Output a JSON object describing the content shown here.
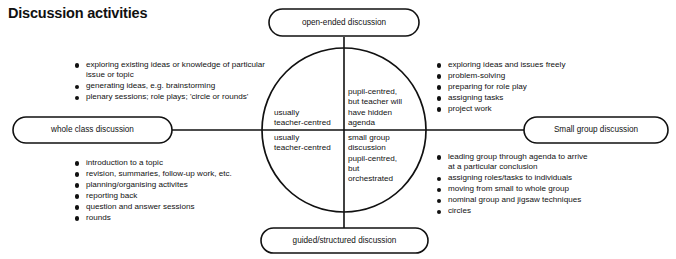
{
  "page": {
    "title": "Discussion activities",
    "background_color": "#ffffff",
    "line_color": "#111111",
    "text_color": "#111111"
  },
  "diagram": {
    "type": "quadrant-circle-diagram",
    "center": {
      "x": 344,
      "y": 130,
      "radius": 82
    },
    "nodes": [
      {
        "id": "open-ended",
        "label": "open-ended discussion",
        "position": "top"
      },
      {
        "id": "guided-structured",
        "label": "guided/structured discussion",
        "position": "bottom"
      },
      {
        "id": "whole-class",
        "label": "whole class discussion",
        "position": "left"
      },
      {
        "id": "small-group",
        "label": "Small group discussion",
        "position": "right"
      }
    ],
    "quadrants": [
      {
        "id": "top-left",
        "lines": [
          "usually",
          "teacher-centred"
        ]
      },
      {
        "id": "bottom-left",
        "lines": [
          "usually",
          "teacher-centred"
        ]
      },
      {
        "id": "top-right",
        "lines": [
          "pupil-centred,",
          "but teacher will",
          "have hidden",
          "agenda"
        ]
      },
      {
        "id": "bottom-right",
        "lines": [
          "small group",
          "discussion",
          "pupil-centred,",
          "but",
          "orchestrated"
        ]
      }
    ],
    "bullet_groups": [
      {
        "id": "top-left-activities",
        "items": [
          "exploring existing ideas or knowledge of particular\nissue or topic",
          "generating ideas, e.g. brainstorming",
          "plenary sessions; role plays; 'circle or rounds'"
        ]
      },
      {
        "id": "top-right-activities",
        "items": [
          "exploring ideas and issues freely",
          "problem-solving",
          "preparing for role play",
          "assigning tasks",
          "project work"
        ]
      },
      {
        "id": "bottom-left-activities",
        "items": [
          "introduction to a topic",
          "revision, summaries, follow-up work, etc.",
          "planning/organising activites",
          "reporting back",
          "question and answer sessions",
          "rounds"
        ]
      },
      {
        "id": "bottom-right-activities",
        "items": [
          "leading group through agenda to arrive\nat a particular conclusion",
          "assigning roles/tasks to individuals",
          "moving from small to whole group",
          "nominal group and jigsaw techniques",
          "circles"
        ]
      }
    ]
  }
}
